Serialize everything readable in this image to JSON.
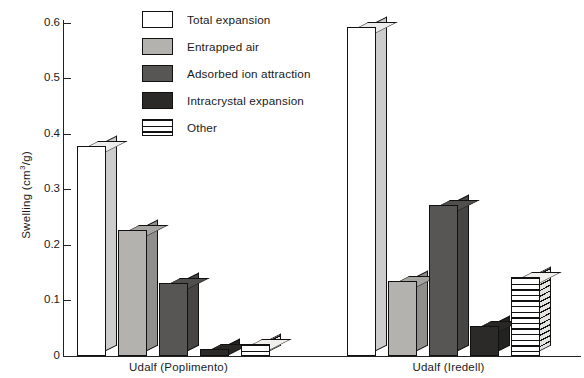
{
  "chart_data": {
    "type": "bar",
    "title": "",
    "subtitle": "",
    "xlabel": "",
    "ylabel": "Swelling (cm3/g)",
    "ylabel_parts": {
      "pre": "Swelling (cm",
      "sup": "3",
      "post": "/g)"
    },
    "ylim": [
      0,
      0.62
    ],
    "yticks": [
      0,
      0.1,
      0.2,
      0.3,
      0.4,
      0.5,
      0.6
    ],
    "ytick_labels": [
      "0",
      "0.1",
      "0.2",
      "0.3",
      "0.4",
      "0.5",
      "0.6"
    ],
    "grid": false,
    "legend_position": "top-center",
    "categories": [
      "Udalf (Poplimento)",
      "Udalf (Iredell)"
    ],
    "series": [
      {
        "name": "Total expansion",
        "values": [
          0.378,
          0.592
        ],
        "color": "#ffffff",
        "pattern": "solid"
      },
      {
        "name": "Entrapped air",
        "values": [
          0.227,
          0.135
        ],
        "color": "#b4b2ae",
        "pattern": "solid"
      },
      {
        "name": "Adsorbed ion attraction",
        "values": [
          0.131,
          0.272
        ],
        "color": "#585654",
        "pattern": "solid"
      },
      {
        "name": "Intracrystal expansion",
        "values": [
          0.012,
          0.054
        ],
        "color": "#2b2a29",
        "pattern": "solid"
      },
      {
        "name": "Other",
        "values": [
          0.021,
          0.142
        ],
        "color": "#ffffff",
        "pattern": "horizontal-stripes"
      }
    ]
  },
  "legend": {
    "items": [
      {
        "label": "Total expansion",
        "swatch": "legend-swatch-total-expansion"
      },
      {
        "label": "Entrapped air",
        "swatch": "legend-swatch-entrapped-air"
      },
      {
        "label": "Adsorbed ion attraction",
        "swatch": "legend-swatch-adsorbed-ion-attraction"
      },
      {
        "label": "Intracrystal expansion",
        "swatch": "legend-swatch-intracrystal-expansion"
      },
      {
        "label": "Other",
        "swatch": "legend-swatch-other"
      }
    ]
  },
  "colors": {
    "axis": "#222222",
    "background": "#ffffff",
    "series_total_expansion": "#ffffff",
    "series_entrapped_air": "#b4b2ae",
    "series_adsorbed_ion_attraction": "#585654",
    "series_intracrystal_expansion": "#2b2a29",
    "series_other": "#ffffff"
  }
}
